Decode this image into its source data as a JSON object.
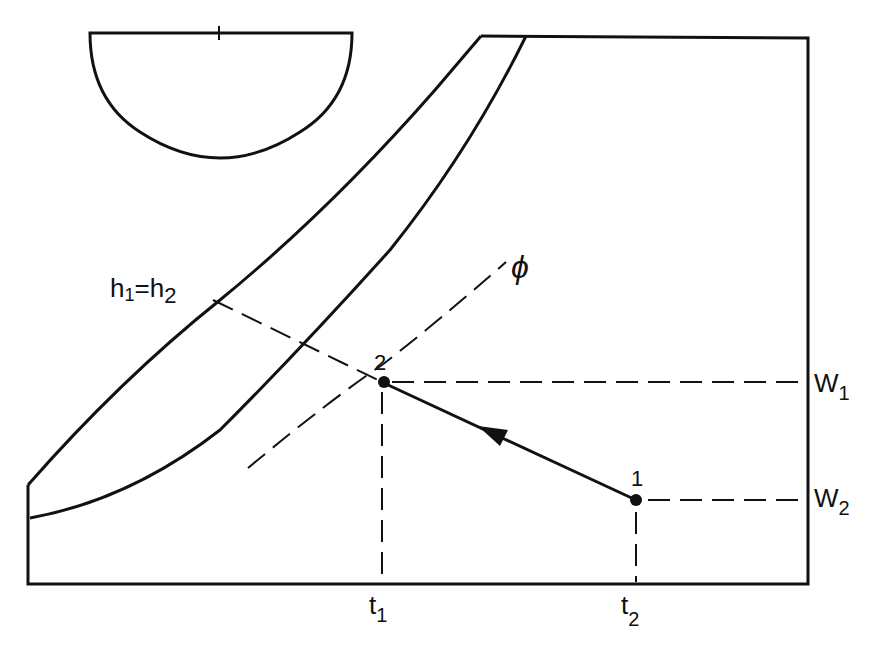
{
  "diagram": {
    "type": "psychrometric-chart-process",
    "labels": {
      "enthalpy": "h",
      "enthalpy_sub1": "1",
      "enthalpy_eq": "=",
      "enthalpy_sub2": "2",
      "relative_humidity": "ϕ",
      "point_1": "1",
      "point_2": "2",
      "w": "W",
      "w1_sub": "1",
      "w2_sub": "2",
      "t": "t",
      "t1_sub": "1",
      "t2_sub": "2"
    },
    "colors": {
      "line": "#111111",
      "background": "#ffffff"
    },
    "points": [
      {
        "id": "1",
        "x": 636,
        "y": 500
      },
      {
        "id": "2",
        "x": 382,
        "y": 382
      }
    ],
    "process": {
      "from": "1",
      "to": "2",
      "arrow": "toward-2"
    }
  }
}
